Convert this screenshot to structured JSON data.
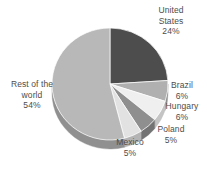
{
  "chart_data": {
    "type": "pie",
    "title": "",
    "subtitle": "",
    "xlabel": "",
    "ylabel": "",
    "legend_position": "none",
    "grid": false,
    "style": "3d-pie",
    "start_angle_deg": 0,
    "direction": "clockwise",
    "categories": [
      "United States",
      "Brazil",
      "Hungary",
      "Poland",
      "Mexico",
      "Rest of the world"
    ],
    "values": [
      24,
      6,
      6,
      5,
      5,
      54
    ],
    "unit": "%",
    "slices": [
      {
        "name": "United States",
        "label": "United\nStates\n24%",
        "value": 24,
        "value_text": "24%",
        "color": "#4d4d4d",
        "side_color": "#3a3a3a"
      },
      {
        "name": "Brazil",
        "label": "Brazil\n6%",
        "value": 6,
        "value_text": "6%",
        "color": "#b0b0b0",
        "side_color": "#8d8d8d"
      },
      {
        "name": "Hungary",
        "label": "Hungary\n6%",
        "value": 6,
        "value_text": "6%",
        "color": "#efefef",
        "side_color": "#c4c4c4"
      },
      {
        "name": "Poland",
        "label": "Poland\n5%",
        "value": 5,
        "value_text": "5%",
        "color": "#8f8f8f",
        "side_color": "#737373"
      },
      {
        "name": "Mexico",
        "label": "Mexico\n5%",
        "value": 5,
        "value_text": "5%",
        "color": "#e2e2e2",
        "side_color": "#b4b4b4"
      },
      {
        "name": "Rest of the world",
        "label": "Rest of the\nworld\n54%",
        "value": 54,
        "value_text": "54%",
        "color": "#b8b8b8",
        "side_color": "#909090"
      }
    ]
  },
  "geometry": {
    "cx": 110,
    "cy": 84,
    "rx": 58,
    "ry": 56,
    "depth": 9
  },
  "colors": {
    "background": "#ffffff",
    "text": "#4d4d4d"
  }
}
